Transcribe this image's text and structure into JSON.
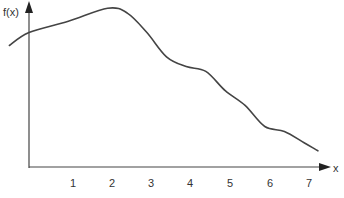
{
  "chart_data": {
    "type": "line",
    "title": "",
    "xlabel": "x",
    "ylabel": "f(x)",
    "x_ticks": [
      "1",
      "2",
      "3",
      "4",
      "5",
      "6",
      "7"
    ],
    "xlim": [
      -0.55,
      7.7
    ],
    "ylim": [
      0,
      10
    ],
    "grid": false,
    "legend": null,
    "series": [
      {
        "name": "f(x)",
        "x": [
          -0.5,
          0,
          1,
          2,
          2.5,
          3,
          3.5,
          4,
          4.5,
          5,
          5.5,
          6,
          6.5,
          7,
          7.35
        ],
        "y": [
          7.5,
          8.3,
          9.0,
          9.8,
          9.5,
          8.3,
          6.8,
          6.2,
          5.9,
          4.7,
          3.8,
          2.5,
          2.2,
          1.5,
          1.0
        ]
      }
    ]
  },
  "colors": {
    "axis": "#444444",
    "curve": "#444444",
    "text": "#333333"
  }
}
